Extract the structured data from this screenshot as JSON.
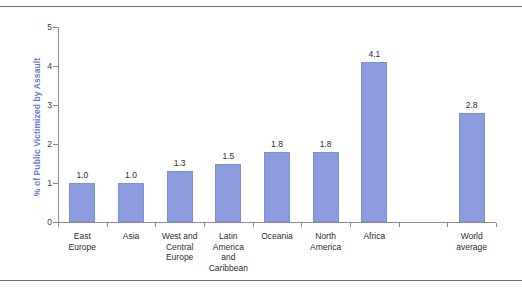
{
  "figure": {
    "background_color": "#ffffff",
    "frame_rule_color": "#6d6d72"
  },
  "chart_data": {
    "type": "bar",
    "title": "",
    "xlabel": "",
    "ylabel": "% of Public Victimized by Assault",
    "categories": [
      "East\nEurope",
      "Asia",
      "West and\nCentral\nEurope",
      "Latin\nAmerica\nand\nCaribbean",
      "Oceania",
      "North\nAmerica",
      "Africa",
      "World\naverage"
    ],
    "values": [
      1.0,
      1.0,
      1.3,
      1.5,
      1.8,
      1.8,
      4.1,
      2.8
    ],
    "value_labels": [
      "1.0",
      "1.0",
      "1.3",
      "1.5",
      "1.8",
      "1.8",
      "4.1",
      "2.8"
    ],
    "ylim": [
      0,
      5
    ],
    "yticks": [
      0,
      1,
      2,
      3,
      4,
      5
    ],
    "ytick_labels": [
      "0",
      "1",
      "2",
      "3",
      "4",
      "5"
    ],
    "grid": false,
    "legend": null,
    "bar_color": "#8b9bdd",
    "bar_edge_color": "#7e8ed4",
    "axis_color": "#8c8c8c",
    "ylabel_color": "#6a7ad0",
    "note": "World average bar is separated from the regional bars by a gap"
  }
}
